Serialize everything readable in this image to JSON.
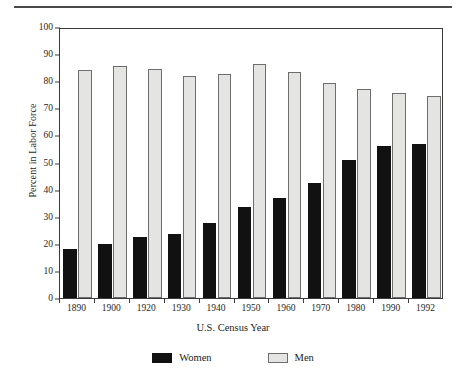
{
  "figure": {
    "ylabel": "Percent in Labor Force",
    "xlabel": "U.S. Census Year",
    "legend": [
      {
        "key": "women",
        "label": "Women",
        "color": "#111111"
      },
      {
        "key": "men",
        "label": "Men",
        "color": "#e4e4e2"
      }
    ]
  },
  "chart_data": {
    "type": "bar",
    "title": "",
    "xlabel": "U.S. Census Year",
    "ylabel": "Percent in Labor Force",
    "categories": [
      "1890",
      "1900",
      "1920",
      "1930",
      "1940",
      "1950",
      "1960",
      "1970",
      "1980",
      "1990",
      "1992"
    ],
    "series": [
      {
        "name": "Women",
        "color": "#111111",
        "values": [
          18,
          20,
          22.5,
          23.5,
          27.5,
          33.5,
          37,
          42.5,
          51,
          56,
          57
        ]
      },
      {
        "name": "Men",
        "color": "#e4e4e2",
        "values": [
          84,
          85.5,
          84.5,
          82,
          82.5,
          86.5,
          83.5,
          79.5,
          77,
          75.5,
          74.5
        ]
      }
    ],
    "ylim": [
      0,
      100
    ],
    "yticks": [
      "0",
      "10",
      "20",
      "30",
      "40",
      "50",
      "60",
      "70",
      "80",
      "90",
      "100"
    ],
    "grid": false,
    "legend_position": "bottom"
  }
}
